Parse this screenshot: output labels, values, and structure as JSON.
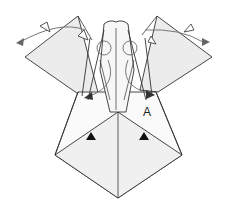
{
  "diagram": {
    "type": "origami-fold-step",
    "labels": [
      {
        "id": "point-a",
        "text": "A"
      }
    ],
    "colors": {
      "line": "#333333",
      "fill_light": "#f2f2f2",
      "fill_shade": "#e6e6e6",
      "arrow": "#777777",
      "arrowhead_solid": "#111111"
    }
  }
}
